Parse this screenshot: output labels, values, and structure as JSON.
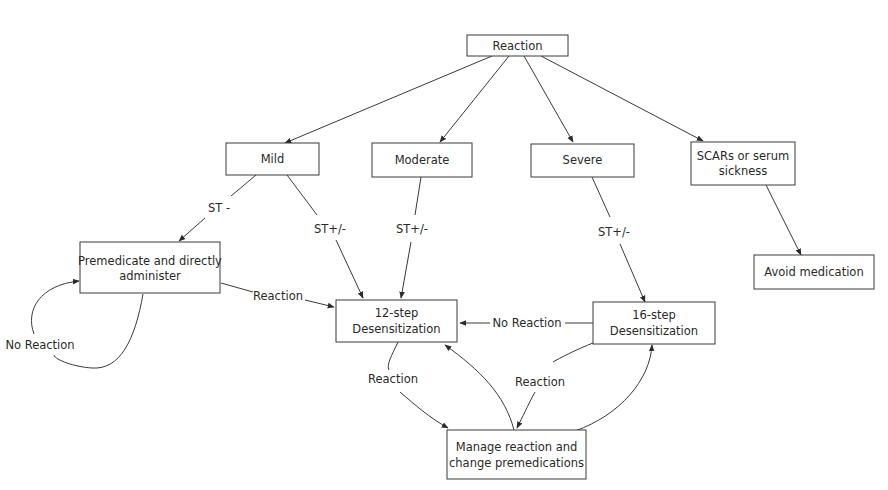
{
  "diagram": {
    "nodes": {
      "reaction": {
        "line1": "Reaction"
      },
      "mild": {
        "line1": "Mild"
      },
      "moderate": {
        "line1": "Moderate"
      },
      "severe": {
        "line1": "Severe"
      },
      "scars": {
        "line1": "SCARs or serum",
        "line2": "sickness"
      },
      "premedicate": {
        "line1": "Premedicate and directly",
        "line2": "administer"
      },
      "avoid": {
        "line1": "Avoid medication"
      },
      "step12": {
        "line1": "12-step",
        "line2": "Desensitization"
      },
      "step16": {
        "line1": "16-step",
        "line2": "Desensitization"
      },
      "manage": {
        "line1": "Manage reaction and",
        "line2": "change premedications"
      }
    },
    "edge_labels": {
      "mild_to_premedicate": "ST -",
      "mild_to_12": "ST+/-",
      "moderate_to_12": "ST+/-",
      "severe_to_16": "ST+/-",
      "premedicate_to_12": "Reaction",
      "premedicate_loop": "No Reaction",
      "step16_to_12": "No Reaction",
      "step12_to_manage": "Reaction",
      "step16_to_manage": "Reaction"
    },
    "colors": {
      "stroke": "#3a3a3a",
      "text": "#2a2a2a",
      "background": "#ffffff"
    }
  }
}
